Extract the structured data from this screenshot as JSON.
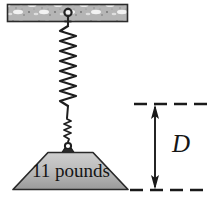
{
  "figure": {
    "kind": "physics-diagram",
    "background_color": "#ffffff"
  },
  "ceiling": {
    "name": "hatched ceiling beam",
    "fill_color": "#b9b9b9",
    "stroke_color": "#2b2b2b",
    "x": 7,
    "y": 4,
    "width": 121,
    "height": 18
  },
  "anchor": {
    "name": "eyelet ring anchor",
    "color": "#262626"
  },
  "spring": {
    "name": "helical spring",
    "color": "#1e1e1e",
    "coils": 14,
    "top_y": 26,
    "bottom_y": 107,
    "center_x": 68,
    "half_width": 8
  },
  "wire": {
    "name": "connecting wire",
    "color": "#1e1e1e"
  },
  "hook": {
    "name": "hook attachment to weight",
    "color": "#1f1f1f"
  },
  "weight": {
    "name": "trapezoidal weight block",
    "label": "11 pounds",
    "value": "11",
    "unit": "pounds",
    "fill_top_color": "#c9c9c9",
    "fill_bottom_color": "#9d9d9d",
    "stroke_color": "#2a2a2a",
    "top_left_x": 48,
    "top_right_x": 93,
    "bottom_left_x": 13,
    "bottom_right_x": 128,
    "top_y": 152,
    "bottom_y": 190
  },
  "dimension": {
    "name": "distance annotation",
    "label": "D",
    "line_color": "#1a1a1a",
    "arrow_x": 155,
    "top_y": 104,
    "bottom_y": 190,
    "dash_left_x": 134,
    "dash_right_x": 208
  }
}
